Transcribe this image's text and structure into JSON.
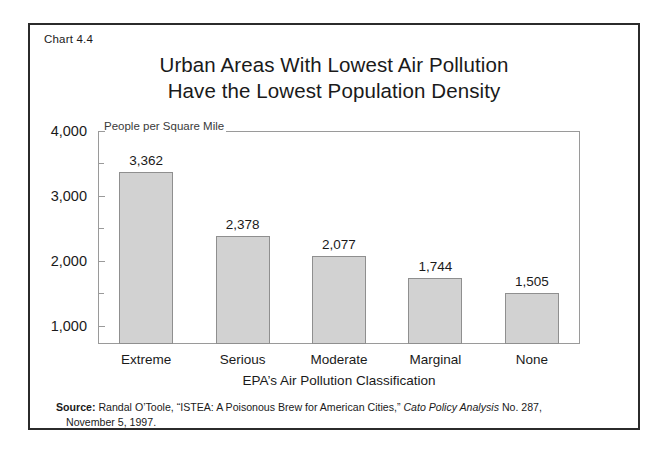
{
  "figure": {
    "chart_number": "Chart 4.4",
    "title_line1": "Urban Areas With Lowest Air Pollution",
    "title_line2": "Have the Lowest Population Density",
    "axis_note": "People per Square Mile",
    "xaxis_title": "EPA’s Air Pollution Classification"
  },
  "source": {
    "label": "Source:",
    "text_before_italic": " Randal O’Toole, “ISTEA: A Poisonous Brew for American Cities,” ",
    "italic_text": "Cato Policy Analysis",
    "text_after_italic": " No. 287,",
    "line2": "November 5, 1997."
  },
  "colors": {
    "bar_fill": "#d2d2d2",
    "bar_stroke": "#8f8f8f",
    "frame": "#9a9a9a",
    "border": "#2b2b2b",
    "text": "#1a1a1a"
  },
  "chart_data": {
    "type": "bar",
    "title": "Urban Areas With Lowest Air Pollution Have the Lowest Population Density",
    "subtitle": "",
    "xlabel": "EPA’s Air Pollution Classification",
    "ylabel": "People per Square Mile",
    "categories": [
      "Extreme",
      "Serious",
      "Moderate",
      "Marginal",
      "None"
    ],
    "values": [
      3362,
      2378,
      2077,
      1744,
      1505
    ],
    "value_labels": [
      "3,362",
      "2,378",
      "2,077",
      "1,744",
      "1,505"
    ],
    "ylim": [
      720,
      4000
    ],
    "ytick_major": [
      1000,
      2000,
      3000,
      4000
    ],
    "ytick_major_labels": [
      "1,000",
      "2,000",
      "3,000",
      "4,000"
    ],
    "ytick_minor": [
      1500,
      2500,
      3500
    ],
    "ytick_step": 500,
    "grid": false,
    "legend": false
  }
}
